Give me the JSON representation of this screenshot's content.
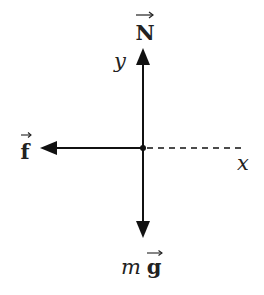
{
  "diagram": {
    "origin": {
      "x": 143,
      "y": 148
    },
    "colors": {
      "ink": "#111111",
      "text": "#222222",
      "background": "#ffffff"
    },
    "forces": [
      {
        "id": "normal",
        "symbol": "N",
        "vector": true,
        "direction": "up",
        "label": "N"
      },
      {
        "id": "friction",
        "symbol": "f",
        "vector": true,
        "direction": "left",
        "label": "f"
      },
      {
        "id": "weight",
        "symbol": "mg",
        "vector": true,
        "direction": "down",
        "label_prefix": "m",
        "label_vector": "g"
      }
    ],
    "axes": {
      "y_label": "y",
      "x_label": "x",
      "x_axis_style": "dashed"
    }
  }
}
